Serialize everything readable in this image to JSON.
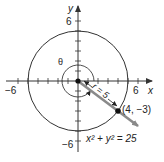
{
  "diagram": {
    "type": "polar-coordinate-diagram",
    "axes": {
      "x_label": "x",
      "y_label": "y",
      "x_min_label": "−6",
      "x_max_label": "6",
      "y_max_label": "6",
      "y_min_label": "−6",
      "range": [
        -6,
        6
      ],
      "tick_step": 1
    },
    "circle": {
      "equation": "x² + y² = 25",
      "radius": 5,
      "center": [
        0,
        0
      ]
    },
    "point": {
      "label": "(4, −3)",
      "x": 4,
      "y": -3
    },
    "radius_label": "r = 5",
    "angle_label": "θ",
    "colors": {
      "axis": "#333333",
      "circle": "#333333",
      "ray": "#8a8a8a",
      "point": "#111111"
    }
  }
}
